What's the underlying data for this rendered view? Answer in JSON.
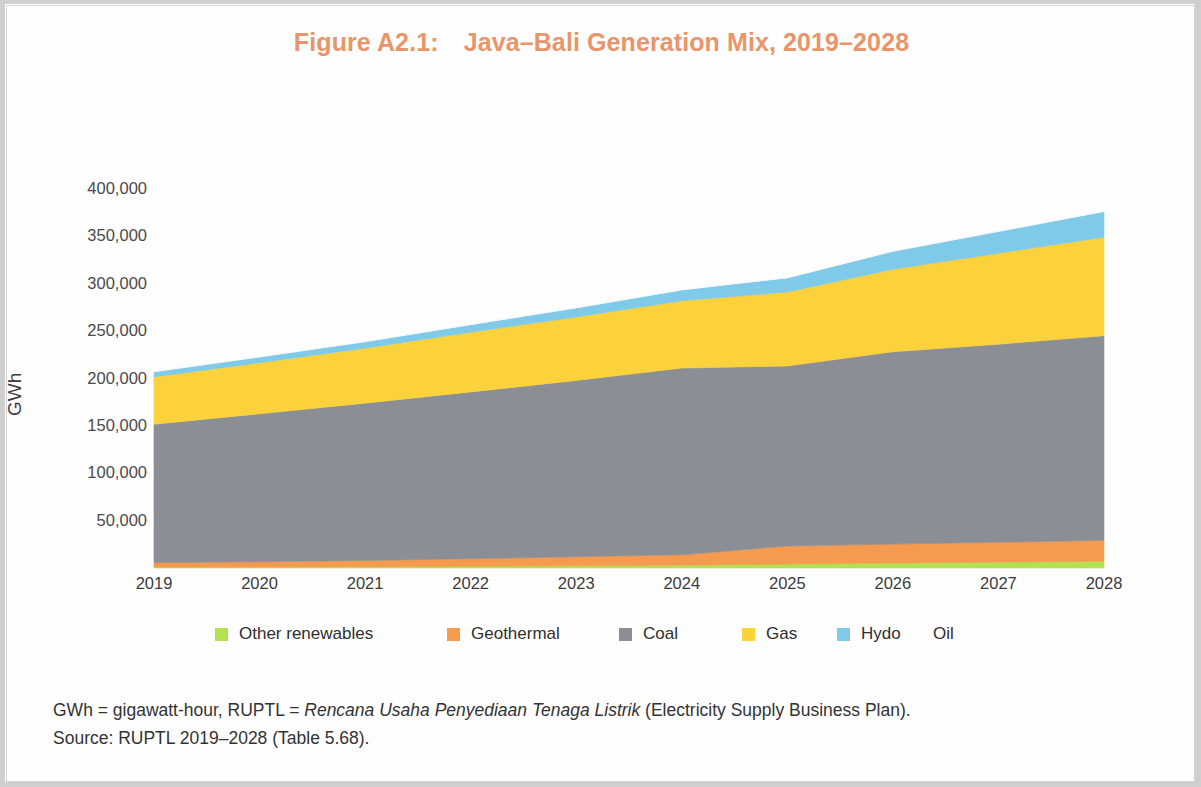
{
  "figure": {
    "label": "Figure A2.1:",
    "title": "Java–Bali Generation Mix, 2019–2028",
    "title_full": "Figure A2.1: Java–Bali Generation Mix, 2019–2028",
    "title_color": "#e8956b"
  },
  "axes": {
    "y_title": "GWh",
    "y_ticks": [
      "400,000",
      "350,000",
      "300,000",
      "250,000",
      "200,000",
      "150,000",
      "100,000",
      "50,000"
    ],
    "x_ticks": [
      "2019",
      "2020",
      "2021",
      "2022",
      "2023",
      "2024",
      "2025",
      "2026",
      "2027",
      "2028"
    ]
  },
  "legend": {
    "items": [
      {
        "label": "Other renewables",
        "color": "#b2e152"
      },
      {
        "label": "Geothermal",
        "color": "#f59a4e"
      },
      {
        "label": "Coal",
        "color": "#8b8e95"
      },
      {
        "label": "Gas",
        "color": "#fbd23b"
      },
      {
        "label": "Hydo",
        "color": "#7fc9e9"
      },
      {
        "label": "Oil",
        "color": "transparent"
      }
    ]
  },
  "notes": {
    "line1_a": "GWh = gigawatt-hour, RUPTL = ",
    "line1_italic": "Rencana Usaha Penyediaan Tenaga Listrik",
    "line1_b": " (Electricity Supply Business Plan).",
    "line2": "Source: RUPTL 2019–2028 (Table 5.68)."
  },
  "chart_data": {
    "type": "area",
    "title": "Java–Bali Generation Mix, 2019–2028",
    "xlabel": "",
    "ylabel": "GWh",
    "stacked": true,
    "grid": false,
    "legend_position": "bottom",
    "ylim": [
      0,
      420000
    ],
    "yticks": [
      50000,
      100000,
      150000,
      200000,
      250000,
      300000,
      350000,
      400000
    ],
    "x": [
      2019,
      2020,
      2021,
      2022,
      2023,
      2024,
      2025,
      2026,
      2027,
      2028
    ],
    "categories": [
      "2019",
      "2020",
      "2021",
      "2022",
      "2023",
      "2024",
      "2025",
      "2026",
      "2027",
      "2028"
    ],
    "series": [
      {
        "name": "Other renewables",
        "color": "#b2e152",
        "values": [
          900,
          1100,
          1400,
          1800,
          2300,
          3000,
          4200,
          5200,
          6200,
          7200
        ]
      },
      {
        "name": "Geothermal",
        "color": "#f59a4e",
        "values": [
          4800,
          5600,
          6600,
          8000,
          9600,
          11000,
          19000,
          20000,
          21000,
          22000
        ]
      },
      {
        "name": "Coal",
        "color": "#8b8e95",
        "values": [
          146000,
          156000,
          166000,
          176000,
          186000,
          197000,
          190000,
          203000,
          209000,
          216000
        ]
      },
      {
        "name": "Gas",
        "color": "#fbd23b",
        "values": [
          50000,
          54000,
          58000,
          63000,
          67000,
          71000,
          78000,
          87000,
          96000,
          104000
        ]
      },
      {
        "name": "Hydo",
        "color": "#7fc9e9",
        "values": [
          5300,
          6000,
          6800,
          8000,
          9600,
          11500,
          15000,
          19000,
          23000,
          27000
        ]
      },
      {
        "name": "Oil",
        "color": "#ffffff",
        "values": [
          300,
          300,
          300,
          300,
          300,
          300,
          300,
          300,
          300,
          300
        ]
      }
    ],
    "totals": [
      207300,
      223000,
      239100,
      257100,
      274800,
      293800,
      306500,
      334500,
      355500,
      376500
    ]
  }
}
